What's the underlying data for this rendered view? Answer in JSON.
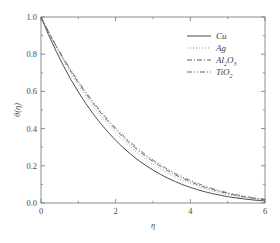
{
  "chart_data": {
    "type": "line",
    "title": "",
    "xlabel": "η",
    "ylabel": "θ(η)",
    "xlim": [
      0,
      6
    ],
    "ylim": [
      0.0,
      1.0
    ],
    "grid": false,
    "legend_position": "upper-right",
    "x_ticks": [
      "0",
      "2",
      "4",
      "6"
    ],
    "x_tick_values": [
      0,
      2,
      4,
      6
    ],
    "x_minor_tick_values": [
      1,
      3,
      5
    ],
    "y_ticks": [
      "0.0",
      "0.2",
      "0.4",
      "0.6",
      "0.8",
      "1.0"
    ],
    "y_tick_values": [
      0.0,
      0.2,
      0.4,
      0.6,
      0.8,
      1.0
    ],
    "y_minor_tick_values": [
      0.1,
      0.3,
      0.5,
      0.7,
      0.9
    ],
    "x": [
      0,
      0.2,
      0.4,
      0.6,
      0.8,
      1.0,
      1.2,
      1.4,
      1.6,
      1.8,
      2.0,
      2.2,
      2.4,
      2.6,
      2.8,
      3.0,
      3.2,
      3.4,
      3.6,
      3.8,
      4.0,
      4.2,
      4.4,
      4.6,
      4.8,
      5.0,
      5.2,
      5.4,
      5.6,
      5.8,
      6.0
    ],
    "series": [
      {
        "name": "Cu",
        "label_base": "Cu",
        "label_sub": "",
        "linestyle": "solid",
        "color": "#4d4d4d",
        "values": [
          1.0,
          0.905,
          0.818,
          0.738,
          0.664,
          0.597,
          0.535,
          0.478,
          0.427,
          0.38,
          0.337,
          0.298,
          0.263,
          0.231,
          0.203,
          0.177,
          0.154,
          0.133,
          0.115,
          0.098,
          0.084,
          0.071,
          0.06,
          0.05,
          0.042,
          0.034,
          0.028,
          0.023,
          0.018,
          0.014,
          0.011
        ]
      },
      {
        "name": "Ag",
        "label_base": "Ag",
        "label_sub": "",
        "linestyle": "dotted",
        "color": "#8c8c8c",
        "values": [
          1.0,
          0.916,
          0.838,
          0.765,
          0.697,
          0.634,
          0.575,
          0.52,
          0.469,
          0.422,
          0.378,
          0.338,
          0.301,
          0.267,
          0.236,
          0.208,
          0.183,
          0.16,
          0.139,
          0.12,
          0.104,
          0.089,
          0.076,
          0.064,
          0.054,
          0.045,
          0.037,
          0.03,
          0.024,
          0.019,
          0.015
        ]
      },
      {
        "name": "Al2O3",
        "label_base": "Al",
        "label_sub": "2",
        "label_base2": "O",
        "label_sub2": "3",
        "linestyle": "dashdot",
        "color": "#5a5a5a",
        "values": [
          1.0,
          0.92,
          0.845,
          0.775,
          0.709,
          0.647,
          0.589,
          0.535,
          0.485,
          0.438,
          0.395,
          0.354,
          0.317,
          0.283,
          0.251,
          0.223,
          0.197,
          0.173,
          0.151,
          0.132,
          0.114,
          0.098,
          0.084,
          0.072,
          0.061,
          0.051,
          0.042,
          0.035,
          0.028,
          0.023,
          0.018
        ]
      },
      {
        "name": "TiO2",
        "label_base": "TiO",
        "label_sub": "2",
        "linestyle": "dashdotdot",
        "color": "#6a6a6a",
        "values": [
          1.0,
          0.922,
          0.849,
          0.78,
          0.715,
          0.654,
          0.597,
          0.543,
          0.493,
          0.447,
          0.404,
          0.363,
          0.326,
          0.292,
          0.26,
          0.231,
          0.205,
          0.181,
          0.159,
          0.139,
          0.121,
          0.105,
          0.09,
          0.077,
          0.066,
          0.055,
          0.046,
          0.038,
          0.031,
          0.025,
          0.02
        ]
      }
    ],
    "legend": [
      {
        "label": "Cu",
        "linestyle": "solid"
      },
      {
        "label": "Ag",
        "linestyle": "dotted"
      },
      {
        "label": "Al2O3",
        "linestyle": "dashdot"
      },
      {
        "label": "TiO2",
        "linestyle": "dashdotdot"
      }
    ]
  },
  "axis": {
    "x_label": "η",
    "y_label_theta": "θ",
    "y_label_paren_open": "(",
    "y_label_eta": "η",
    "y_label_paren_close": ")"
  },
  "ticks": {
    "x": [
      "0",
      "2",
      "4",
      "6"
    ],
    "y": [
      "0.0",
      "0.2",
      "0.4",
      "0.6",
      "0.8",
      "1.0"
    ]
  },
  "legend_text": {
    "cu": "Cu",
    "ag": "Ag",
    "al": "Al",
    "al_sub": "2",
    "al_o": "O",
    "al_o_sub": "3",
    "tio": "TiO",
    "tio_sub": "2"
  },
  "colors": {
    "frame": "#808080",
    "text": "#4a4a4a",
    "cu": "#4d4d4d",
    "ag": "#8c8c8c",
    "al2o3": "#5a5a5a",
    "tio2": "#6a6a6a",
    "background": "#ffffff"
  }
}
